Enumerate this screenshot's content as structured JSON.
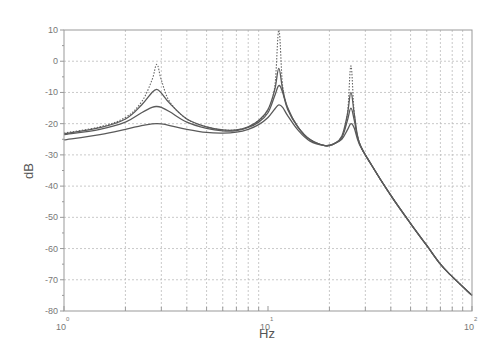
{
  "chart_data": {
    "type": "line",
    "title": "",
    "xlabel": "Hz",
    "ylabel": "dB",
    "xscale": "log",
    "xlim": [
      1,
      100
    ],
    "ylim": [
      -80,
      10
    ],
    "grid": true,
    "legend": null,
    "x_ticks": [
      {
        "value": 1,
        "base": "10",
        "exp": "0"
      },
      {
        "value": 10,
        "base": "10",
        "exp": "1"
      },
      {
        "value": 100,
        "base": "10",
        "exp": "2"
      }
    ],
    "y_ticks": [
      10,
      0,
      -10,
      -20,
      -30,
      -40,
      -50,
      -60,
      -70,
      -80
    ],
    "annotations": [],
    "series": [
      {
        "name": "undamped (dotted)",
        "style": "dotted",
        "x": [
          1,
          1.5,
          2,
          2.4,
          2.7,
          2.85,
          3.0,
          3.3,
          4,
          5,
          6,
          7,
          8,
          9,
          10,
          10.8,
          11.3,
          11.8,
          12.5,
          14,
          16,
          19,
          21,
          23,
          24.5,
          25.5,
          26.5,
          28,
          32,
          40,
          50,
          60,
          70,
          80,
          100
        ],
        "values": [
          -23,
          -21,
          -18,
          -13,
          -6,
          -1,
          -6,
          -13,
          -18.5,
          -21,
          -22,
          -22,
          -21,
          -19,
          -15.5,
          -8,
          10,
          -8,
          -15,
          -21,
          -25,
          -27,
          -26.5,
          -24,
          -17,
          -1.5,
          -17,
          -26,
          -33,
          -43,
          -52,
          -59,
          -65,
          -69,
          -75
        ]
      },
      {
        "name": "light damping",
        "style": "solid",
        "x": [
          1,
          1.5,
          2,
          2.4,
          2.7,
          2.85,
          3.0,
          3.3,
          4,
          5,
          6,
          7,
          8,
          9,
          10,
          10.8,
          11.3,
          11.8,
          12.5,
          14,
          16,
          19,
          21,
          23,
          24.5,
          25.5,
          26.5,
          28,
          32,
          40,
          50,
          60,
          70,
          80,
          100
        ],
        "values": [
          -23.2,
          -21.3,
          -18.5,
          -14,
          -10,
          -9,
          -10.2,
          -13.5,
          -18.5,
          -21,
          -22,
          -22,
          -21,
          -19,
          -15.5,
          -9,
          -2.3,
          -9,
          -15,
          -21,
          -25,
          -27,
          -26.5,
          -24,
          -17,
          -10,
          -17,
          -26,
          -33,
          -43,
          -52,
          -59,
          -65,
          -69,
          -75
        ]
      },
      {
        "name": "medium damping",
        "style": "solid",
        "x": [
          1,
          1.5,
          2,
          2.4,
          2.7,
          2.85,
          3.0,
          3.3,
          4,
          5,
          6,
          7,
          8,
          9,
          10,
          10.8,
          11.3,
          11.8,
          12.5,
          14,
          16,
          19,
          21,
          23,
          24.5,
          25.5,
          26.5,
          28,
          32,
          40,
          50,
          60,
          70,
          80,
          100
        ],
        "values": [
          -23.5,
          -21.8,
          -19.5,
          -16.5,
          -14.8,
          -14.5,
          -14.8,
          -16.2,
          -19.5,
          -21.5,
          -22.3,
          -22.2,
          -21.2,
          -19.5,
          -16.5,
          -11,
          -7.8,
          -10,
          -15.5,
          -21,
          -25,
          -27,
          -26.5,
          -24.5,
          -19,
          -15,
          -19,
          -26,
          -33,
          -43,
          -52,
          -59,
          -65,
          -69,
          -75
        ]
      },
      {
        "name": "heavy damping",
        "style": "solid",
        "x": [
          1,
          1.5,
          2,
          2.4,
          2.7,
          2.85,
          3.0,
          3.3,
          4,
          5,
          6,
          7,
          8,
          9,
          10,
          10.8,
          11.3,
          11.8,
          12.5,
          14,
          16,
          19,
          21,
          23,
          24.5,
          25.5,
          26.5,
          28,
          32,
          40,
          50,
          60,
          70,
          80,
          100
        ],
        "values": [
          -25.2,
          -23.5,
          -21.8,
          -20.6,
          -20.1,
          -20,
          -20.1,
          -20.6,
          -21.8,
          -22.8,
          -23,
          -22.7,
          -21.8,
          -20.3,
          -18,
          -15.3,
          -14,
          -14.8,
          -17.5,
          -22,
          -25.5,
          -27,
          -26.5,
          -25,
          -22,
          -20,
          -21.5,
          -26.5,
          -33,
          -43,
          -52,
          -59,
          -65,
          -69,
          -75
        ]
      }
    ]
  }
}
